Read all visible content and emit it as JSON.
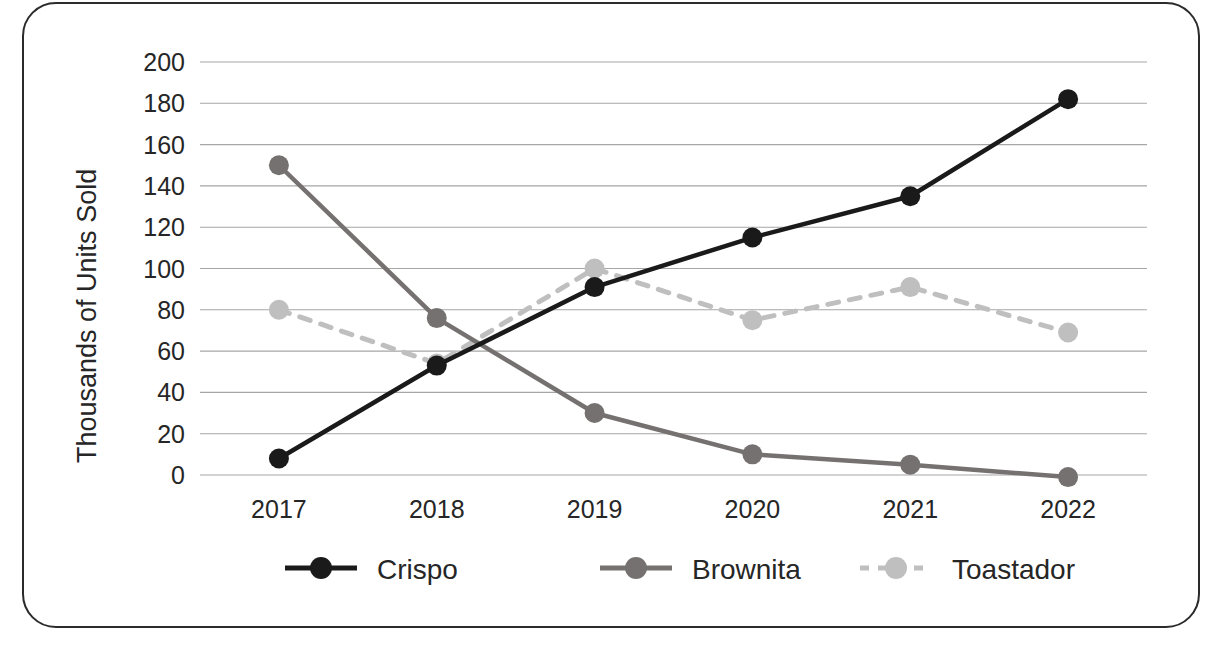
{
  "chart_data": {
    "type": "line",
    "title": "",
    "xlabel": "",
    "ylabel": "Thousands of Units Sold",
    "categories": [
      "2017",
      "2018",
      "2019",
      "2020",
      "2021",
      "2022"
    ],
    "x": [
      2017,
      2018,
      2019,
      2020,
      2021,
      2022
    ],
    "ylim": [
      0,
      200
    ],
    "yticks": [
      0,
      20,
      40,
      60,
      80,
      100,
      120,
      140,
      160,
      180,
      200
    ],
    "ytick_labels": [
      "0",
      "20",
      "40",
      "60",
      "80",
      "100",
      "120",
      "140",
      "160",
      "180",
      "200"
    ],
    "grid": "horizontal",
    "legend_position": "bottom",
    "series": [
      {
        "name": "Crispo",
        "values": [
          8,
          53,
          91,
          115,
          135,
          182
        ],
        "color": "#1a1a1a",
        "line_style": "solid",
        "marker": "circle"
      },
      {
        "name": "Brownita",
        "values": [
          150,
          76,
          30,
          10,
          5,
          -1
        ],
        "color": "#767171",
        "line_style": "solid",
        "marker": "circle"
      },
      {
        "name": "Toastador",
        "values": [
          80,
          54,
          100,
          75,
          91,
          69
        ],
        "color": "#bfbfbf",
        "line_style": "dashed",
        "marker": "circle"
      }
    ]
  },
  "frame": {
    "border_color": "#2b2b2b",
    "background": "#ffffff"
  },
  "legend": {
    "items": [
      {
        "label": "Crispo",
        "color": "#1a1a1a",
        "style": "solid"
      },
      {
        "label": "Brownita",
        "color": "#767171",
        "style": "solid"
      },
      {
        "label": "Toastador",
        "color": "#bfbfbf",
        "style": "dashed"
      }
    ]
  }
}
